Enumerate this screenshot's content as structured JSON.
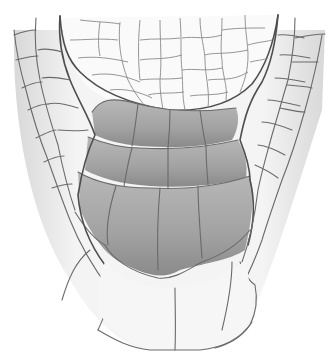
{
  "figure": {
    "colors": {
      "background": "#ffffff",
      "cell_fill_light": "#f2f2f2",
      "cell_shade": "#dcdcdc",
      "columella_fill": "#a8a8a8",
      "columella_shade": "#8c8c8c",
      "cell_wall": "#666666"
    },
    "regions": [
      {
        "name": "meristem",
        "shade": "light"
      },
      {
        "name": "columella-tier-1",
        "shade": "dark"
      },
      {
        "name": "columella-tier-2",
        "shade": "dark"
      },
      {
        "name": "columella-tier-3",
        "shade": "dark"
      },
      {
        "name": "lateral-root-cap",
        "shade": "light"
      },
      {
        "name": "peripheral-cap-cells",
        "shade": "light"
      }
    ]
  }
}
